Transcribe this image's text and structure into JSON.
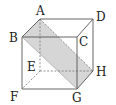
{
  "diagram": {
    "type": "cube-cross-section",
    "colors": {
      "edge": "#555555",
      "hidden_edge": "#777777",
      "shaded_plane": "#d6d6d6",
      "label": "#222222"
    },
    "vertices": {
      "A": {
        "label": "A",
        "x": 40,
        "y": 19
      },
      "B": {
        "label": "B",
        "x": 22,
        "y": 37
      },
      "C": {
        "label": "C",
        "x": 77,
        "y": 37
      },
      "D": {
        "label": "D",
        "x": 93,
        "y": 19
      },
      "E": {
        "label": "E",
        "x": 40,
        "y": 71
      },
      "F": {
        "label": "F",
        "x": 22,
        "y": 89
      },
      "G": {
        "label": "G",
        "x": 77,
        "y": 89
      },
      "H": {
        "label": "H",
        "x": 93,
        "y": 71
      }
    },
    "shaded_face": [
      "A",
      "B",
      "G",
      "H"
    ],
    "visible_edges": [
      [
        "A",
        "D"
      ],
      [
        "B",
        "C"
      ],
      [
        "A",
        "B"
      ],
      [
        "C",
        "D"
      ],
      [
        "B",
        "F"
      ],
      [
        "C",
        "G"
      ],
      [
        "D",
        "H"
      ],
      [
        "F",
        "G"
      ],
      [
        "G",
        "H"
      ]
    ],
    "hidden_edges": [
      [
        "A",
        "E"
      ],
      [
        "E",
        "F"
      ],
      [
        "E",
        "H"
      ],
      [
        "A",
        "H"
      ]
    ]
  }
}
